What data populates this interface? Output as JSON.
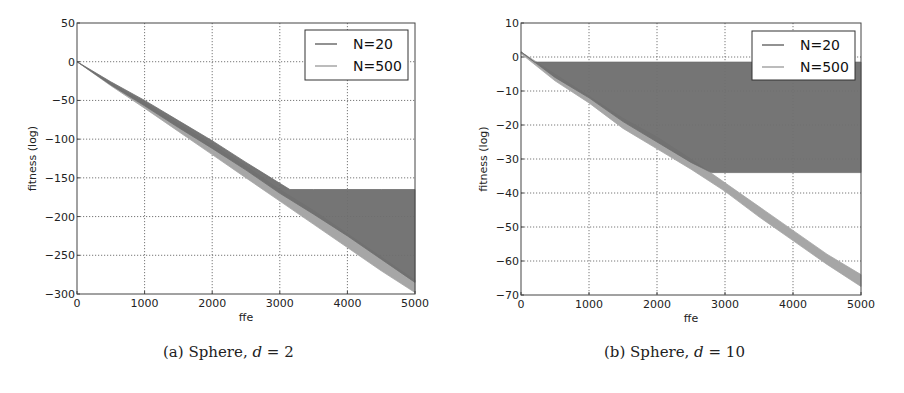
{
  "chart_data": [
    {
      "type": "area",
      "id": "a",
      "caption_label": "(a)",
      "caption_func": "Sphere,",
      "caption_var": "d",
      "caption_eq": "= 2",
      "xlabel": "ffe",
      "ylabel": "fitness (log)",
      "xlim": [
        0,
        5000
      ],
      "ylim": [
        -300,
        50
      ],
      "xticks": [
        0,
        1000,
        2000,
        3000,
        4000,
        5000
      ],
      "yticks": [
        50,
        0,
        -50,
        -100,
        -150,
        -200,
        -250,
        -300
      ],
      "grid": true,
      "legend_position": "upper right",
      "series": [
        {
          "name": "N=20",
          "color": "#6e6e6e",
          "x": [
            0,
            500,
            1000,
            1500,
            2000,
            2500,
            3000,
            3150,
            3500,
            4000,
            4500,
            5000
          ],
          "upper": [
            0,
            -26,
            -50,
            -76,
            -102,
            -130,
            -157,
            -165,
            -165,
            -165,
            -165,
            -165
          ],
          "lower": [
            0,
            -30,
            -57,
            -85,
            -112,
            -140,
            -170,
            -178,
            -197,
            -225,
            -255,
            -285
          ]
        },
        {
          "name": "N=500",
          "color": "#a6a6a6",
          "x": [
            0,
            500,
            1000,
            1500,
            2000,
            2500,
            3000,
            3500,
            4000,
            4500,
            5000
          ],
          "upper": [
            0,
            -28,
            -53,
            -80,
            -107,
            -135,
            -165,
            -192,
            -222,
            -252,
            -282
          ],
          "lower": [
            0,
            -31,
            -60,
            -90,
            -120,
            -150,
            -180,
            -210,
            -240,
            -270,
            -298
          ]
        }
      ]
    },
    {
      "type": "area",
      "id": "b",
      "caption_label": "(b)",
      "caption_func": "Sphere,",
      "caption_var": "d",
      "caption_eq": "= 10",
      "xlabel": "ffe",
      "ylabel": "fitness (log)",
      "xlim": [
        0,
        5000
      ],
      "ylim": [
        -70,
        10
      ],
      "xticks": [
        0,
        1000,
        2000,
        3000,
        4000,
        5000
      ],
      "yticks": [
        10,
        0,
        -10,
        -20,
        -30,
        -40,
        -50,
        -60,
        -70
      ],
      "grid": true,
      "legend_position": "upper right",
      "series": [
        {
          "name": "N=20",
          "color": "#6e6e6e",
          "x": [
            0,
            200,
            500,
            1000,
            1500,
            2000,
            2500,
            2800,
            3000,
            4000,
            5000
          ],
          "upper": [
            1.5,
            -1.5,
            -1.5,
            -1.5,
            -1.5,
            -1.5,
            -1.5,
            -1.5,
            -1.5,
            -1.5,
            -1.5
          ],
          "lower": [
            1.5,
            -1.5,
            -6,
            -12,
            -19,
            -25,
            -31,
            -34,
            -34,
            -34,
            -34
          ]
        },
        {
          "name": "N=500",
          "color": "#a6a6a6",
          "x": [
            0,
            500,
            1000,
            1500,
            2000,
            2500,
            3000,
            3500,
            4000,
            4500,
            5000
          ],
          "upper": [
            1.5,
            -5,
            -11.5,
            -18,
            -23.5,
            -30,
            -37,
            -44,
            -51,
            -58,
            -64
          ],
          "lower": [
            1.0,
            -7,
            -13.5,
            -21,
            -27,
            -33,
            -39.5,
            -47,
            -54,
            -61,
            -67.5
          ]
        }
      ]
    }
  ]
}
